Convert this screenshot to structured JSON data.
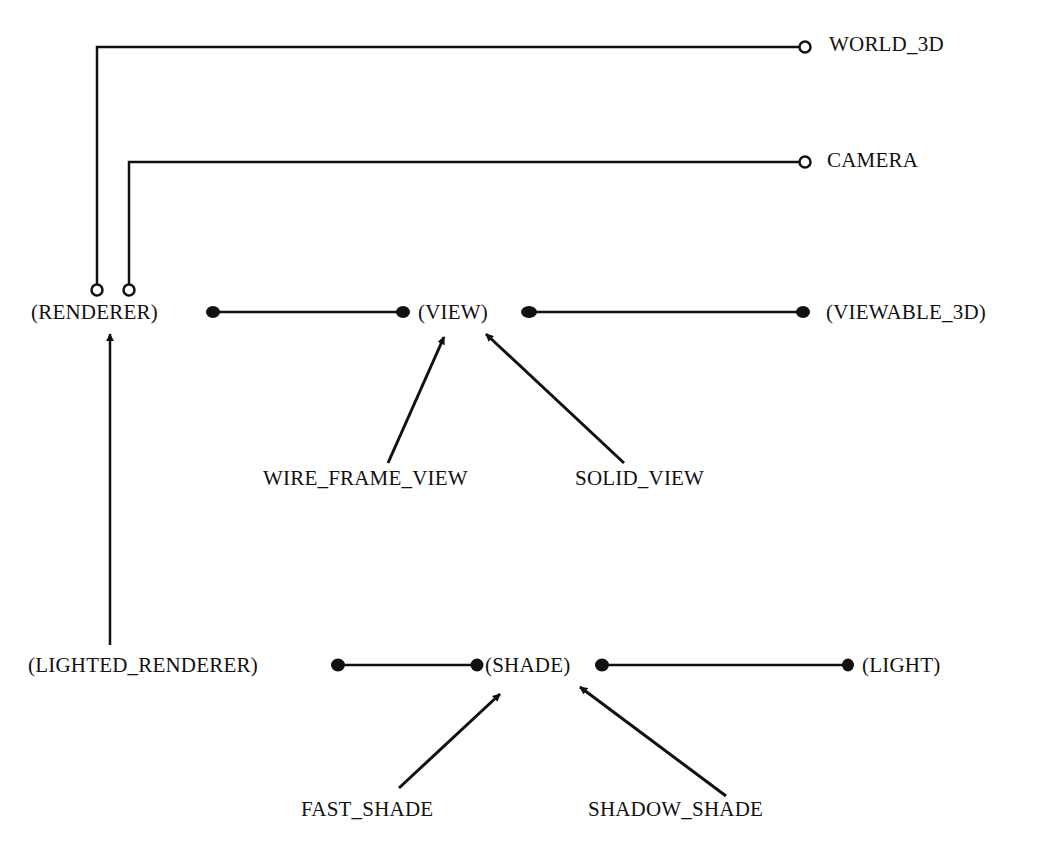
{
  "diagram": {
    "type": "class-relationship-diagram",
    "colors": {
      "line": "#111111",
      "background": "#ffffff"
    },
    "nodes": {
      "world_3d": "WORLD_3D",
      "camera": "CAMERA",
      "renderer": "(RENDERER)",
      "view": "(VIEW)",
      "viewable_3d": "(VIEWABLE_3D)",
      "wire_frame_view": "WIRE_FRAME_VIEW",
      "solid_view": "SOLID_VIEW",
      "lighted_renderer": "(LIGHTED_RENDERER)",
      "shade": "(SHADE)",
      "light": "(LIGHT)",
      "fast_shade": "FAST_SHADE",
      "shadow_shade": "SHADOW_SHADE"
    },
    "edges": [
      {
        "from": "renderer",
        "to": "world_3d",
        "style": "open-circle-ends"
      },
      {
        "from": "renderer",
        "to": "camera",
        "style": "open-circle-ends"
      },
      {
        "from": "renderer",
        "to": "view",
        "style": "filled-dot-ends"
      },
      {
        "from": "view",
        "to": "viewable_3d",
        "style": "filled-dot-ends"
      },
      {
        "from": "wire_frame_view",
        "to": "view",
        "style": "arrow"
      },
      {
        "from": "solid_view",
        "to": "view",
        "style": "arrow"
      },
      {
        "from": "lighted_renderer",
        "to": "renderer",
        "style": "arrow"
      },
      {
        "from": "lighted_renderer",
        "to": "shade",
        "style": "filled-dot-ends"
      },
      {
        "from": "shade",
        "to": "light",
        "style": "filled-dot-ends"
      },
      {
        "from": "fast_shade",
        "to": "shade",
        "style": "arrow"
      },
      {
        "from": "shadow_shade",
        "to": "shade",
        "style": "arrow"
      }
    ]
  }
}
